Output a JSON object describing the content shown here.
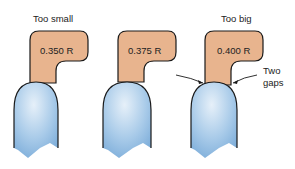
{
  "diagram": {
    "title_labels": {
      "left": "Too small",
      "right": "Too big"
    },
    "gauges": [
      {
        "id": "small",
        "radius_label": "0.350 R",
        "fit": "Too small"
      },
      {
        "id": "correct",
        "radius_label": "0.375 R",
        "fit": ""
      },
      {
        "id": "big",
        "radius_label": "0.400 R",
        "fit": "Too big"
      }
    ],
    "annotation": {
      "line1": "Two",
      "line2": "gaps"
    },
    "colors": {
      "gauge_fill": "#e8b48e",
      "part_fill_light": "#e3eef8",
      "part_fill_dark": "#7fb0dc",
      "outline": "#1a1a1a"
    }
  }
}
